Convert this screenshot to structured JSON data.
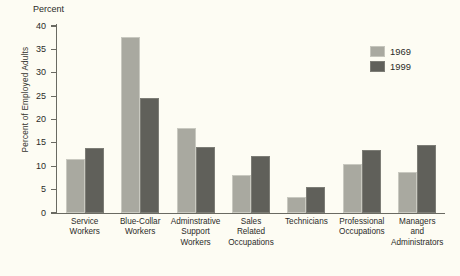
{
  "chart_data": {
    "type": "bar",
    "title": "",
    "axis_header": "Percent",
    "xlabel": "",
    "ylabel": "Percent of Employed Adults",
    "ylim": [
      0,
      40
    ],
    "ytick_step": 5,
    "yticks": [
      "0",
      "5",
      "10",
      "15",
      "20",
      "25",
      "30",
      "35",
      "40"
    ],
    "grid": false,
    "legend_position": "top-right",
    "categories": [
      "Service Workers",
      "Blue-Collar Workers",
      "Adminstrative Support Workers",
      "Sales Related Occupations",
      "Technicians",
      "Professional Occupations",
      "Managers and Administrators"
    ],
    "category_lines": [
      [
        "Service",
        "Workers"
      ],
      [
        "Blue-Collar",
        "Workers"
      ],
      [
        "Adminstrative",
        "Support",
        "Workers"
      ],
      [
        "Sales",
        "Related",
        "Occupations"
      ],
      [
        "Technicians"
      ],
      [
        "Professional",
        "Occupations"
      ],
      [
        "Managers",
        "and",
        "Administrators"
      ]
    ],
    "series": [
      {
        "name": "1969",
        "color": "#a9a9a0",
        "values": [
          11.6,
          37.7,
          18.2,
          8.1,
          3.4,
          10.5,
          8.8
        ]
      },
      {
        "name": "1999",
        "color": "#60605a",
        "values": [
          14.0,
          24.7,
          14.1,
          12.1,
          5.6,
          13.4,
          14.5
        ]
      }
    ]
  },
  "legend": {
    "items": [
      {
        "label": "1969"
      },
      {
        "label": "1999"
      }
    ]
  },
  "colors": {
    "background": "#fdfcf3",
    "axis": "#6a6a62",
    "text": "#2b2b28",
    "series_1969": "#a9a9a0",
    "series_1999": "#60605a"
  }
}
